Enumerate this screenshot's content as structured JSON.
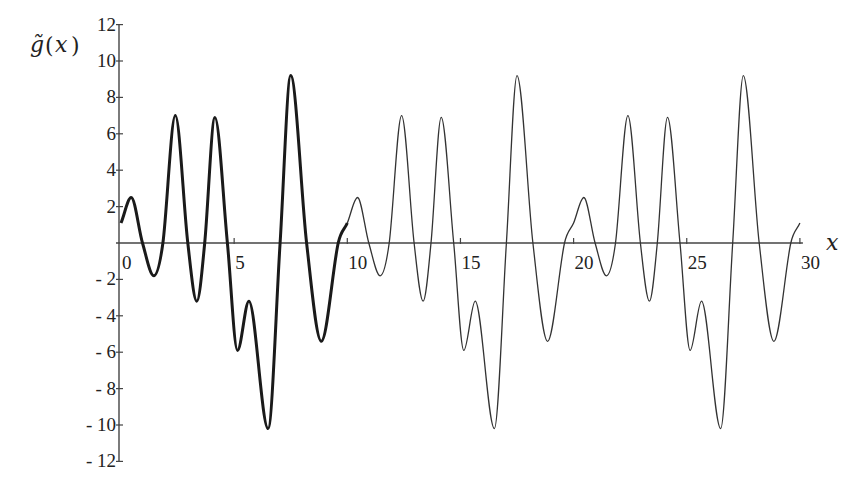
{
  "chart_data": {
    "type": "line",
    "title": "",
    "xlabel": "x",
    "ylabel": "g̃(x)",
    "xlim": [
      0,
      30
    ],
    "ylim": [
      -12,
      12
    ],
    "grid": false,
    "legend": null,
    "x_ticks": [
      0,
      5,
      10,
      15,
      20,
      25,
      30
    ],
    "x_tick_labels": [
      "0",
      "5",
      "10",
      "15",
      "20",
      "25",
      "30"
    ],
    "y_ticks": [
      -12,
      -10,
      -8,
      -6,
      -4,
      -2,
      2,
      4,
      6,
      8,
      10,
      12
    ],
    "y_tick_labels": [
      "-12",
      "-10",
      "-8",
      "-6",
      "-4",
      "-2",
      "2",
      "4",
      "6",
      "8",
      "10",
      "12"
    ],
    "period": 10,
    "annotations": [
      "First period (0 to 10) drawn with thick line; periodic extension (10 to 30) drawn with thin line"
    ],
    "series": [
      {
        "name": "g̃(x) one period",
        "style": "thick",
        "x": [
          0,
          0.45,
          0.95,
          1.45,
          1.85,
          2.4,
          2.95,
          3.35,
          3.7,
          4.15,
          4.7,
          5.15,
          5.65,
          6.5,
          7.03,
          7.5,
          8.2,
          8.85,
          9.6,
          10
        ],
        "y": [
          1.1,
          2.5,
          0,
          -1.8,
          0,
          7.0,
          0,
          -3.2,
          0,
          6.9,
          0,
          -5.9,
          -3.2,
          -10.2,
          0,
          9.2,
          0,
          -5.4,
          0,
          1.1
        ]
      },
      {
        "name": "g̃(x) periodic extension",
        "style": "thin",
        "x_range": [
          10,
          30
        ],
        "note": "repeats the 0–10 period"
      }
    ]
  },
  "axes": {
    "x_title": "x",
    "y_title_g": "g̃",
    "y_title_paren_open": "(",
    "y_title_var": "x",
    "y_title_paren_close": ")"
  }
}
